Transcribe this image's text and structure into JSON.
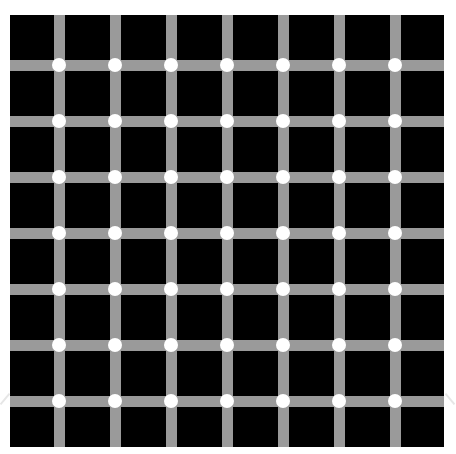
{
  "illusion": {
    "type": "scintillating-grid",
    "colors": {
      "background": "#ffffff",
      "squares": "#000000",
      "lines": "#9a9a9a",
      "dots": "#ffffff"
    },
    "grid": {
      "columns": 8,
      "rows": 8,
      "vertical_line_count": 7,
      "horizontal_line_count": 7,
      "dot_count": 49
    }
  }
}
